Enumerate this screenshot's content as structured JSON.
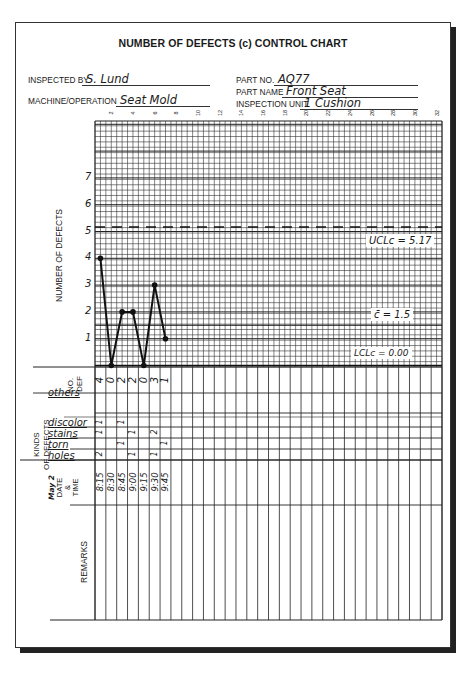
{
  "form": {
    "title": "NUMBER OF DEFECTS (c) CONTROL CHART",
    "inspected_by_label": "INSPECTED BY",
    "inspected_by": "S. Lund",
    "machine_label": "MACHINE/OPERATION",
    "machine": "Seat Mold",
    "part_no_label": "PART NO.",
    "part_no": "AQ77",
    "part_name_label": "PART NAME",
    "part_name": "Front Seat",
    "inspection_unit_label": "INSPECTION UNIT",
    "inspection_unit": "1 Cushion"
  },
  "chart": {
    "y_axis_label": "NUMBER OF DEFECTS",
    "y_ticks": [
      "1",
      "2",
      "3",
      "4",
      "5",
      "6",
      "7"
    ],
    "x_ticks": [
      "2",
      "4",
      "6",
      "8",
      "10",
      "12",
      "14",
      "16",
      "18",
      "20",
      "22",
      "24",
      "26",
      "28",
      "30",
      "32"
    ],
    "ucl_label": "UCLc = 5.17",
    "center_label": "c̄ = 1.5",
    "lcl_label": "LCLc = 0.00"
  },
  "chart_data": {
    "type": "line",
    "title": "NUMBER OF DEFECTS (c) CONTROL CHART",
    "xlabel": "Sample number",
    "ylabel": "NUMBER OF DEFECTS",
    "x": [
      1,
      2,
      3,
      4,
      5,
      6,
      7
    ],
    "values": [
      4,
      0,
      2,
      2,
      0,
      3,
      1
    ],
    "ylim": [
      0,
      8
    ],
    "xlim": [
      0,
      32
    ],
    "ucl": 5.17,
    "center": 1.5,
    "lcl": 0.0,
    "annotations": [
      "UCLc = 5.17",
      "c̄ = 1.5",
      "LCLc = 0.00"
    ],
    "grid": true
  },
  "table": {
    "no_def_label_1": "NO.",
    "no_def_label_2": "DEF",
    "no_def": [
      "4",
      "0",
      "2",
      "2",
      "0",
      "3",
      "1"
    ],
    "kinds_label_1": "KINDS",
    "kinds_label_2": "OF DEFECTS",
    "kinds": [
      {
        "name": "others",
        "tallies": [
          "",
          "",
          "",
          "",
          "",
          "",
          ""
        ]
      },
      {
        "name": "",
        "tallies": [
          "",
          "",
          "",
          "",
          "",
          "",
          ""
        ]
      },
      {
        "name": "discolor",
        "tallies": [
          "1",
          "",
          "1",
          "",
          "",
          "",
          ""
        ]
      },
      {
        "name": "stains",
        "tallies": [
          "1",
          "",
          "",
          "1",
          "",
          "2",
          ""
        ]
      },
      {
        "name": "torn",
        "tallies": [
          "",
          "",
          "1",
          "",
          "",
          "",
          "1"
        ]
      },
      {
        "name": "holes",
        "tallies": [
          "2",
          "",
          "",
          "1",
          "",
          "1",
          ""
        ]
      }
    ],
    "date_label_1": "May 2",
    "date_label_2": "DATE",
    "date_label_3": "&",
    "date_label_4": "TIME",
    "times": [
      "8:15",
      "8:30",
      "8:45",
      "9:00",
      "9:15",
      "9:30",
      "9:45"
    ],
    "remarks_label": "REMARKS"
  }
}
